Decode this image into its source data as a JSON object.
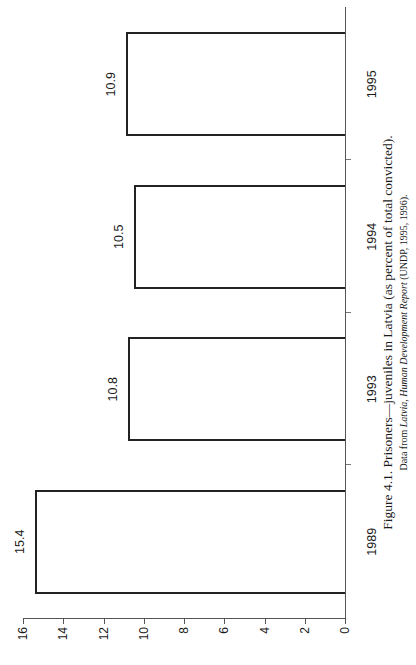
{
  "chart_data": {
    "type": "bar",
    "orientation": "vertical bars, page rotated 90° counter-clockwise",
    "title": "Figure 4.1. Prisoners—juveniles in Latvia (as percent of total convicted).",
    "subtitle_prefix": "Data from ",
    "subtitle_source_italic": "Latvia, Human Development Report",
    "subtitle_suffix": " (UNDP, 1995, 1996).",
    "categories": [
      "1989",
      "1993",
      "1994",
      "1995"
    ],
    "values": [
      15.4,
      10.8,
      10.5,
      10.9
    ],
    "data_labels": [
      "15.4",
      "10.8",
      "10.5",
      "10.9"
    ],
    "xlabel": "",
    "ylabel": "",
    "ylim": [
      0,
      16
    ],
    "yticks": [
      "0",
      "2",
      "4",
      "6",
      "8",
      "10",
      "12",
      "14",
      "16"
    ],
    "grid": false,
    "legend": null,
    "bar_fill": "#ffffff",
    "bar_edge": "#222222"
  }
}
